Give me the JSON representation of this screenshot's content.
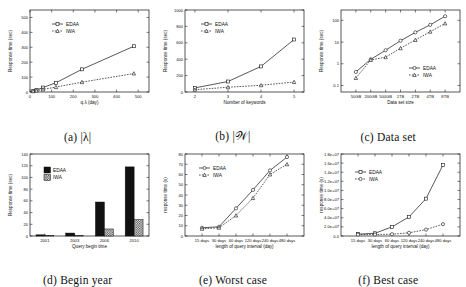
{
  "figure": {
    "series_names": [
      "EDAA",
      "IWA"
    ],
    "panels": [
      "a",
      "b",
      "c",
      "d",
      "e",
      "f"
    ]
  },
  "panel_a": {
    "caption_index": "(a)",
    "caption_text": "|λ|",
    "legend": [
      "EDAA",
      "IWA"
    ]
  },
  "panel_b": {
    "caption_index": "(b)",
    "caption_text": "|𝒲|",
    "legend": [
      "EDAA",
      "IWA"
    ]
  },
  "panel_c": {
    "caption_index": "(c)",
    "caption_text": "Data set",
    "legend": [
      "EDAA",
      "IWA"
    ]
  },
  "panel_d": {
    "caption_index": "(d)",
    "caption_text": "Begin year",
    "legend": [
      "EDAA",
      "IWA"
    ]
  },
  "panel_e": {
    "caption_index": "(e)",
    "caption_text": "Worst case",
    "legend": [
      "EDAA",
      "IWA"
    ]
  },
  "panel_f": {
    "caption_index": "(f)",
    "caption_text": "Best case",
    "legend": [
      "EDAA",
      "IWA"
    ]
  },
  "chart_data": [
    {
      "id": "a",
      "type": "line",
      "title": "",
      "xlabel": "q.λ (day)",
      "ylabel": "Response time (sec)",
      "xlim": [
        0,
        550
      ],
      "ylim": [
        0,
        550
      ],
      "xticks": [
        0,
        100,
        200,
        300,
        400,
        500
      ],
      "xticklabels": [
        "0",
        "100",
        "200",
        "300",
        "400",
        "500"
      ],
      "yticks": [
        0,
        100,
        200,
        300,
        400,
        500
      ],
      "yticklabels": [
        "0",
        "100",
        "200",
        "300",
        "400",
        "500"
      ],
      "grid": false,
      "legend_position": "upper-left",
      "x": [
        15,
        30,
        60,
        120,
        240,
        480
      ],
      "series": [
        {
          "name": "EDAA",
          "style": "solid",
          "marker": "square",
          "values": [
            8,
            14,
            30,
            62,
            152,
            307
          ]
        },
        {
          "name": "IWA",
          "style": "dotted",
          "marker": "triangle",
          "values": [
            5,
            9,
            17,
            33,
            66,
            124
          ]
        }
      ]
    },
    {
      "id": "b",
      "type": "line",
      "title": "",
      "xlabel": "Number of keywords",
      "ylabel": "Response time (sec)",
      "xlim": [
        1.7,
        5.3
      ],
      "ylim": [
        0,
        1000
      ],
      "xticks": [
        2,
        3,
        4,
        5
      ],
      "xticklabels": [
        "2",
        "3",
        "4",
        "5"
      ],
      "yticks": [
        0,
        200,
        400,
        600,
        800,
        1000
      ],
      "yticklabels": [
        "0",
        "200",
        "400",
        "600",
        "800",
        "1000"
      ],
      "grid": false,
      "legend_position": "upper-left",
      "x": [
        2,
        3,
        4,
        5
      ],
      "series": [
        {
          "name": "EDAA",
          "style": "solid",
          "marker": "square",
          "values": [
            50,
            128,
            312,
            640
          ]
        },
        {
          "name": "IWA",
          "style": "dotted",
          "marker": "triangle",
          "values": [
            28,
            58,
            82,
            122
          ]
        }
      ]
    },
    {
      "id": "c",
      "type": "line",
      "title": "",
      "xlabel": "Data set size",
      "ylabel": "Response time (sec)",
      "yscale": "log",
      "ylim": [
        0.05,
        300
      ],
      "xticks": [
        0,
        1,
        2,
        3,
        4,
        5,
        6
      ],
      "xticklabels": [
        "50GB",
        "200GB",
        "500GB",
        "1TB",
        "2TB",
        "4TB",
        "8TB"
      ],
      "yticks": [
        0.1,
        1,
        10,
        100
      ],
      "yticklabels": [
        "0.1",
        "1",
        "10",
        "100"
      ],
      "grid": false,
      "legend_position": "lower-right",
      "series": [
        {
          "name": "EDAA",
          "style": "solid",
          "marker": "circle",
          "values": [
            0.42,
            1.6,
            4.2,
            11.5,
            28,
            62,
            155
          ]
        },
        {
          "name": "IWA",
          "style": "dotted",
          "marker": "triangle",
          "values": [
            0.22,
            1.5,
            2.0,
            5.2,
            12.5,
            30,
            72
          ]
        }
      ]
    },
    {
      "id": "d",
      "type": "bar",
      "title": "",
      "xlabel": "Query begin time",
      "ylabel": "Response time (sec)",
      "categories": [
        "2001",
        "2003",
        "2006",
        "2010"
      ],
      "ylim": [
        0,
        140
      ],
      "yticks": [
        0,
        20,
        40,
        60,
        80,
        100,
        120,
        140
      ],
      "yticklabels": [
        "0",
        "20",
        "40",
        "60",
        "80",
        "100",
        "120",
        "140"
      ],
      "grid": false,
      "legend_position": "upper-left",
      "series": [
        {
          "name": "EDAA",
          "fill": "solid-black",
          "values": [
            2,
            5,
            58,
            118
          ]
        },
        {
          "name": "IWA",
          "fill": "checker",
          "values": [
            1,
            1,
            12,
            28
          ]
        }
      ]
    },
    {
      "id": "e",
      "type": "line",
      "title": "",
      "xlabel": "length of query interval (day)",
      "ylabel": "response time (s)",
      "categories": [
        "15 days",
        "30 days",
        "60 days",
        "120 days",
        "240 days",
        "480 days"
      ],
      "ylim": [
        0,
        80
      ],
      "yticks": [
        0,
        10,
        20,
        30,
        40,
        50,
        60,
        70,
        80
      ],
      "yticklabels": [
        "0",
        "10",
        "20",
        "30",
        "40",
        "50",
        "60",
        "70",
        "80"
      ],
      "grid": false,
      "legend_position": "upper-left",
      "series": [
        {
          "name": "EDAA",
          "style": "solid",
          "marker": "circle",
          "values": [
            8,
            9,
            27,
            45,
            64,
            77
          ]
        },
        {
          "name": "IWA",
          "style": "dotted",
          "marker": "triangle",
          "values": [
            7,
            8,
            20,
            37,
            60,
            70
          ]
        }
      ]
    },
    {
      "id": "f",
      "type": "line",
      "title": "",
      "xlabel": "length of query interval (day)",
      "ylabel": "response time (s)",
      "categories": [
        "15 days",
        "30 days",
        "60 days",
        "120 days",
        "240 days",
        "480 days"
      ],
      "ylim": [
        0,
        18000000
      ],
      "yticks": [
        0,
        2000000,
        4000000,
        6000000,
        8000000,
        10000000,
        12000000,
        14000000,
        16000000,
        18000000
      ],
      "yticklabels": [
        "0.0",
        "2.0e+07",
        "4.0e+07",
        "6.0e+07",
        "8.0e+07",
        "1.0e+07",
        "1.2e+07",
        "1.4e+07",
        "1.6e+07",
        "1.8e+07"
      ],
      "grid": false,
      "legend_position": "upper-left",
      "series": [
        {
          "name": "EDAA",
          "style": "solid",
          "marker": "square",
          "values": [
            400000,
            600000,
            2000000,
            4200000,
            8200000,
            15600000
          ]
        },
        {
          "name": "IWA",
          "style": "dotted",
          "marker": "circle",
          "values": [
            300000,
            320000,
            400000,
            700000,
            1400000,
            2600000
          ]
        }
      ]
    }
  ]
}
